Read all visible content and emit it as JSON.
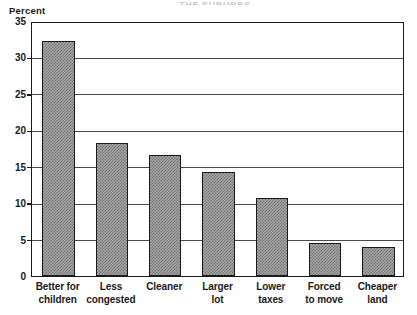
{
  "figure": {
    "title_remnant": "THE SUBURBS",
    "y_axis_title": "Percent"
  },
  "chart_data": {
    "type": "bar",
    "title": "",
    "xlabel": "",
    "ylabel": "Percent",
    "ylim": [
      0,
      35
    ],
    "yticks": [
      0,
      5,
      10,
      15,
      20,
      25,
      30,
      35
    ],
    "ytick_labels": [
      "0",
      "5",
      "10",
      "15",
      "20",
      "25",
      "30",
      "35"
    ],
    "gridlines": [
      5,
      10,
      15,
      20,
      25,
      30
    ],
    "grid": true,
    "legend": "none",
    "bar_fill": "gray-crosshatch",
    "bar_edge_color": "#1b1b1b",
    "categories": [
      "Better for children",
      "Less congested",
      "Cleaner",
      "Larger lot",
      "Lower taxes",
      "Forced to move",
      "Cheaper land"
    ],
    "category_lines": [
      [
        "Better for",
        "children"
      ],
      [
        "Less",
        "congested"
      ],
      [
        "Cleaner",
        ""
      ],
      [
        "Larger",
        "lot"
      ],
      [
        "Lower",
        "taxes"
      ],
      [
        "Forced",
        "to move"
      ],
      [
        "Cheaper",
        "land"
      ]
    ],
    "values": [
      32.0,
      18.0,
      16.4,
      14.0,
      10.5,
      4.3,
      3.8
    ]
  }
}
